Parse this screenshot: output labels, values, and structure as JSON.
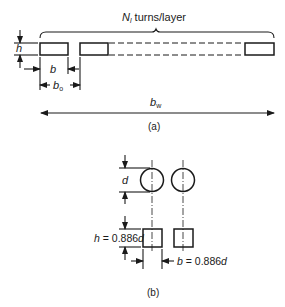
{
  "figure": {
    "part_a": {
      "caption": "(a)",
      "brace_label_main": "N",
      "brace_label_sub": "l",
      "brace_label_rest": " turns/layer",
      "height_label": "h",
      "width_label": "b",
      "pitch_label_main": "b",
      "pitch_label_sub": "o",
      "winding_width_main": "b",
      "winding_width_sub": "w"
    },
    "part_b": {
      "caption": "(b)",
      "diameter_label": "d",
      "height_eq_var": "h",
      "height_eq_value": " = 0.886",
      "height_eq_d": "d",
      "width_eq_var": "b",
      "width_eq_value": " = 0.886",
      "width_eq_d": "d"
    }
  }
}
